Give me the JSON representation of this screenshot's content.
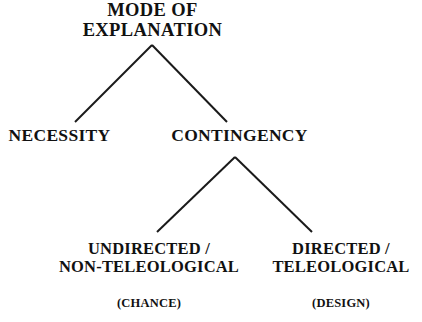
{
  "diagram": {
    "title": "MODE OF EXPLANATION",
    "type": "hierarchical-tree",
    "background_color": "#ffffff",
    "line_color": "#1a1a1a",
    "text_color": "#111111",
    "nodes": {
      "root": {
        "line1": "MODE OF",
        "line2": "EXPLANATION"
      },
      "necessity": {
        "label": "NECESSITY"
      },
      "contingency": {
        "label": "CONTINGENCY"
      },
      "undirected": {
        "line1": "UNDIRECTED /",
        "line2": "NON-TELEOLOGICAL",
        "annotation": "(CHANCE)"
      },
      "directed": {
        "line1": "DIRECTED /",
        "line2": "TELEOLOGICAL",
        "annotation": "(DESIGN)"
      }
    }
  }
}
